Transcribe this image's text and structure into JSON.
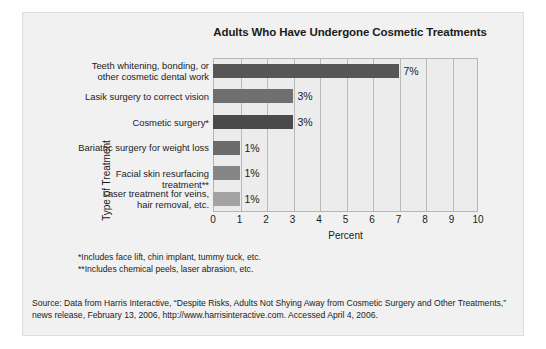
{
  "chart_data": {
    "type": "bar",
    "orientation": "horizontal",
    "title": "Adults Who Have Undergone Cosmetic Treatments",
    "xlabel": "Percent",
    "ylabel": "Type of Treatment",
    "xlim": [
      0,
      10
    ],
    "xticks": [
      "0",
      "1",
      "2",
      "3",
      "4",
      "5",
      "6",
      "7",
      "8",
      "9",
      "10"
    ],
    "grid": true,
    "legend": "none",
    "categories": [
      "Teeth whitening, bonding, or other cosmetic dental work",
      "Lasik surgery to correct vision",
      "Cosmetic surgery*",
      "Bariatric surgery for weight loss",
      "Facial skin resurfacing treatment**",
      "Laser treatment for veins, hair removal, etc."
    ],
    "category_lines": [
      [
        "Teeth whitening, bonding, or",
        "other cosmetic dental work"
      ],
      [
        "Lasik surgery to correct vision"
      ],
      [
        "Cosmetic surgery*"
      ],
      [
        "Bariatric surgery for weight loss"
      ],
      [
        "Facial skin resurfacing treatment**"
      ],
      [
        "Laser treatment for veins,",
        "hair removal, etc."
      ]
    ],
    "values": [
      7,
      3,
      3,
      1,
      1,
      1
    ],
    "data_labels": [
      "7%",
      "3%",
      "3%",
      "1%",
      "1%",
      "1%"
    ],
    "bar_colors": [
      "#565656",
      "#6f6f6f",
      "#4a4a4a",
      "#6b6b6b",
      "#858585",
      "#a3a3a3"
    ]
  },
  "footnotes": [
    "*Includes face lift, chin implant, tummy tuck, etc.",
    "**Includes chemical peels, laser abrasion, etc."
  ],
  "source": {
    "text": "Source: Data from Harris Interactive, “Despite Risks, Adults Not Shying Away from Cosmetic Surgery and Other Treatments,” news release, February 13, 2006, http://www.harrisinteractive.com. Accessed April 4, 2006."
  },
  "colors": {
    "panel_background": "#f1f1f1",
    "plot_background": "#ececec",
    "plot_border": "#b6b6b6",
    "gridline": "#b9b9b9",
    "text": "#1b1b1b"
  }
}
